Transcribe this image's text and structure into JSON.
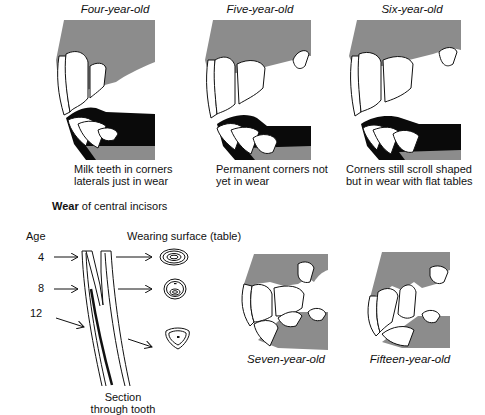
{
  "top_panels": [
    {
      "title": "Four-year-old",
      "caption_line1": "Milk teeth in corners",
      "caption_line2": "laterals just in wear"
    },
    {
      "title": "Five-year-old",
      "caption_line1": "Permanent corners not",
      "caption_line2": "yet in wear"
    },
    {
      "title": "Six-year-old",
      "caption_line1": "Corners still scroll shaped",
      "caption_line2": "but in wear with flat tables"
    }
  ],
  "section": {
    "heading_bold": "Wear",
    "heading_rest": " of central incisors",
    "age_label": "Age",
    "surface_label": "Wearing surface (table)",
    "ages": [
      "4",
      "8",
      "12"
    ],
    "tooth_caption_line1": "Section",
    "tooth_caption_line2": "through tooth"
  },
  "bottom_panels": [
    {
      "title": "Seven-year-old"
    },
    {
      "title": "Fifteen-year-old"
    }
  ],
  "colors": {
    "gum": "#8c8c8c",
    "mouth": "#0a0a0a",
    "tooth": "#ffffff",
    "ink": "#111111"
  }
}
